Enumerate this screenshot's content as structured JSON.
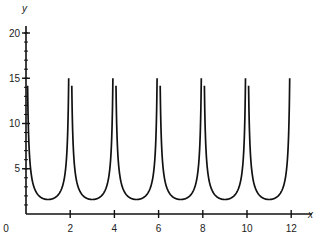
{
  "chart_data": {
    "type": "line",
    "title": "",
    "xlabel": "x",
    "ylabel": "y",
    "xlim": [
      0,
      12.4
    ],
    "ylim": [
      0,
      21
    ],
    "x_ticks": [
      0,
      2,
      4,
      6,
      8,
      10,
      12
    ],
    "x_tick_labels": [
      "0",
      "2",
      "4",
      "6",
      "8",
      "10",
      "12"
    ],
    "y_ticks": [
      5,
      10,
      15,
      20
    ],
    "y_tick_labels": [
      "5",
      "10",
      "15",
      "20"
    ],
    "y_minor_tick_step": 1,
    "grid": false,
    "legend": null,
    "series": [
      {
        "name": "y = 1.6·|csc(πx/2)| (periodic, clipped at 16)",
        "description": "Periodic U-shaped branches between vertical asymptotes at even x; minima ≈1.6 at odd x; peaks clipped at y≈16",
        "x": [
          0.1,
          0.5,
          1,
          1.5,
          1.9,
          2.1,
          2.5,
          3,
          3.5,
          3.9,
          4.1,
          4.5,
          5,
          5.5,
          5.9,
          6.1,
          6.5,
          7,
          7.5,
          7.9,
          8.1,
          8.5,
          9,
          9.5,
          9.9,
          10.1,
          10.5,
          11,
          11.5,
          11.9
        ],
        "y": [
          10.2,
          2.26,
          1.6,
          2.26,
          10.2,
          10.2,
          2.26,
          1.6,
          2.26,
          10.2,
          10.2,
          2.26,
          1.6,
          2.26,
          10.2,
          10.2,
          2.26,
          1.6,
          2.26,
          10.2,
          10.2,
          2.26,
          1.6,
          2.26,
          10.2,
          10.2,
          2.26,
          1.6,
          2.26,
          10.2
        ],
        "minima": [
          {
            "x": 1,
            "y": 1.6
          },
          {
            "x": 3,
            "y": 1.6
          },
          {
            "x": 5,
            "y": 1.6
          },
          {
            "x": 7,
            "y": 1.6
          },
          {
            "x": 9,
            "y": 1.6
          },
          {
            "x": 11,
            "y": 1.6
          }
        ],
        "asymptotes_x": [
          0,
          2,
          4,
          6,
          8,
          10,
          12
        ],
        "clip_y": 16
      }
    ]
  }
}
